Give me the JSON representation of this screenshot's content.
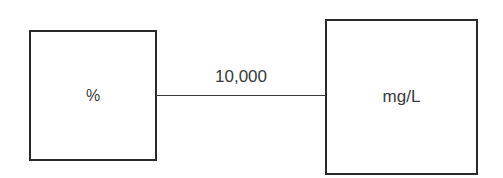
{
  "diagram": {
    "left_node": {
      "label": "%"
    },
    "right_node": {
      "label": "mg/L"
    },
    "edge": {
      "label": "10,000"
    },
    "colors": {
      "stroke": "#2a2a2a",
      "text": "#3a3a3a",
      "background": "#ffffff"
    }
  }
}
